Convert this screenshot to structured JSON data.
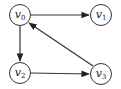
{
  "graph": {
    "type": "directed",
    "nodes": [
      {
        "id": "v0",
        "base": "v",
        "sub": "0",
        "cx": 20,
        "cy": 15
      },
      {
        "id": "v1",
        "base": "v",
        "sub": "1",
        "cx": 101,
        "cy": 15
      },
      {
        "id": "v2",
        "base": "v",
        "sub": "2",
        "cx": 20,
        "cy": 73
      },
      {
        "id": "v3",
        "base": "v",
        "sub": "3",
        "cx": 101,
        "cy": 74
      }
    ],
    "edges": [
      {
        "from": "v0",
        "to": "v1"
      },
      {
        "from": "v0",
        "to": "v2"
      },
      {
        "from": "v2",
        "to": "v3"
      },
      {
        "from": "v3",
        "to": "v0"
      }
    ]
  }
}
